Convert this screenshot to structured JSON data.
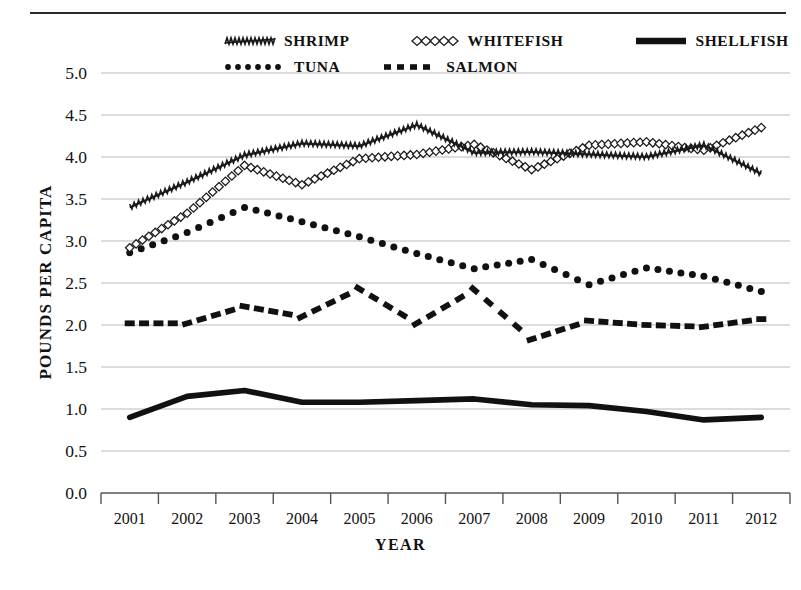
{
  "chart_data": {
    "type": "line",
    "title": "",
    "xlabel": "YEAR",
    "ylabel": "POUNDS PER CAPITA",
    "x": [
      2001,
      2002,
      2003,
      2004,
      2005,
      2006,
      2007,
      2008,
      2009,
      2010,
      2011,
      2012
    ],
    "categories": [
      "2001",
      "2002",
      "2003",
      "2004",
      "2005",
      "2006",
      "2007",
      "2008",
      "2009",
      "2010",
      "2011",
      "2012"
    ],
    "xlim": [
      2001,
      2012
    ],
    "ylim": [
      0.0,
      5.0
    ],
    "ytick_labels": [
      "0.0",
      "0.5",
      "1.0",
      "1.5",
      "2.0",
      "2.5",
      "3.0",
      "3.5",
      "4.0",
      "4.5",
      "5.0"
    ],
    "ytick_values": [
      0.0,
      0.5,
      1.0,
      1.5,
      2.0,
      2.5,
      3.0,
      3.5,
      4.0,
      4.5,
      5.0
    ],
    "grid": "horizontal",
    "legend_position": "top",
    "series": [
      {
        "name": "SHRIMP",
        "style": "zigzag-line",
        "values": [
          3.4,
          3.7,
          4.02,
          4.16,
          4.13,
          4.38,
          4.05,
          4.06,
          4.03,
          4.0,
          4.14,
          3.8
        ]
      },
      {
        "name": "WHITEFISH",
        "style": "open-diamond-line",
        "values": [
          2.92,
          3.33,
          3.9,
          3.67,
          3.98,
          4.03,
          4.15,
          3.85,
          4.14,
          4.18,
          4.08,
          4.35
        ]
      },
      {
        "name": "SHELLFISH",
        "style": "thick-solid-line",
        "values": [
          0.9,
          1.15,
          1.22,
          1.08,
          1.08,
          1.1,
          1.12,
          1.05,
          1.04,
          0.97,
          0.87,
          0.9
        ]
      },
      {
        "name": "TUNA",
        "style": "dotted-line",
        "values": [
          2.86,
          3.1,
          3.4,
          3.23,
          3.05,
          2.85,
          2.67,
          2.78,
          2.48,
          2.68,
          2.58,
          2.4
        ]
      },
      {
        "name": "SALMON",
        "style": "dashed-line",
        "values": [
          2.02,
          2.02,
          2.22,
          2.1,
          2.43,
          2.02,
          2.42,
          1.83,
          2.05,
          2.0,
          1.98,
          2.07
        ]
      }
    ]
  },
  "legend": {
    "rows": [
      [
        {
          "label": "SHRIMP",
          "marker": "zigzag-line-swatch"
        },
        {
          "label": "WHITEFISH",
          "marker": "open-diamond-swatch"
        },
        {
          "label": "SHELLFISH",
          "marker": "thick-solid-swatch"
        }
      ],
      [
        {
          "label": "TUNA",
          "marker": "dotted-swatch"
        },
        {
          "label": "SALMON",
          "marker": "dashed-swatch"
        }
      ]
    ]
  },
  "colors": {
    "line": "#1a1a1a",
    "grid": "#b9b9b9",
    "axis": "#555555",
    "background": "#ffffff"
  }
}
